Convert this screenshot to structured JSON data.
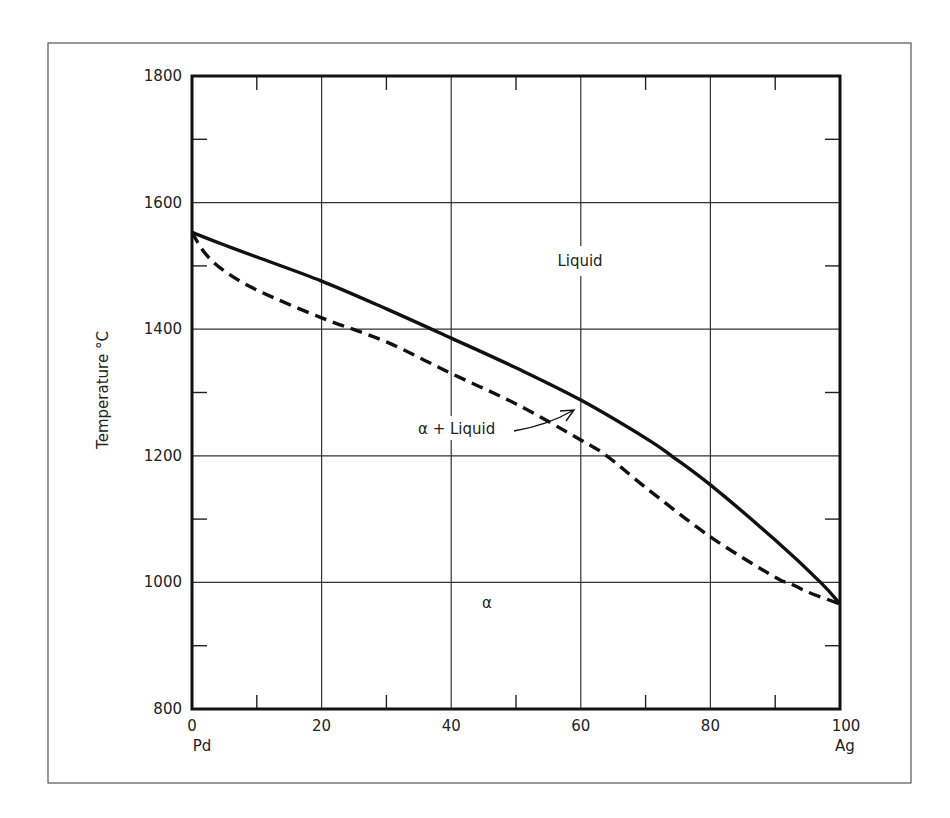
{
  "chart_data": {
    "type": "line",
    "title": "",
    "subtitle": "",
    "xlabel": "",
    "ylabel": "Temperature °C",
    "x_end_labels": {
      "left": "Pd",
      "right": "Ag"
    },
    "xlim": [
      0,
      100
    ],
    "ylim": [
      800,
      1800
    ],
    "x_ticks": [
      0,
      20,
      40,
      60,
      80,
      100
    ],
    "x_tick_labels": [
      "0",
      "20",
      "40",
      "60",
      "80",
      "100"
    ],
    "x_minor_ticks": [
      10,
      30,
      50,
      70,
      90
    ],
    "y_ticks": [
      800,
      1000,
      1200,
      1400,
      1600,
      1800
    ],
    "y_tick_labels": [
      "800",
      "1000",
      "1200",
      "1400",
      "1600",
      "1800"
    ],
    "y_minor_ticks": [
      900,
      1100,
      1300,
      1500,
      1700
    ],
    "grid": true,
    "legend": null,
    "series": [
      {
        "name": "Liquidus",
        "style": "solid",
        "x": [
          0,
          5,
          10,
          20,
          30,
          40,
          50,
          60,
          70,
          74,
          80,
          90,
          97,
          100
        ],
        "y": [
          1553,
          1533,
          1514,
          1476,
          1432,
          1386,
          1339,
          1288,
          1228,
          1200,
          1154,
          1067,
          1000,
          966
        ]
      },
      {
        "name": "Solidus",
        "style": "dashed",
        "x": [
          0,
          2,
          5,
          10,
          20,
          30,
          40,
          50,
          60,
          64,
          70,
          80,
          90,
          92,
          95,
          100
        ],
        "y": [
          1553,
          1520,
          1492,
          1462,
          1418,
          1380,
          1330,
          1282,
          1225,
          1200,
          1150,
          1072,
          1008,
          1000,
          985,
          966
        ]
      }
    ],
    "annotations": [
      {
        "text": "Liquid",
        "x": 60,
        "y": 1520
      },
      {
        "text": "α + Liquid",
        "x": 40,
        "y": 1215,
        "arrow_to": {
          "x": 59,
          "y": 1270
        }
      },
      {
        "text": "α",
        "x": 46,
        "y": 990
      }
    ]
  }
}
